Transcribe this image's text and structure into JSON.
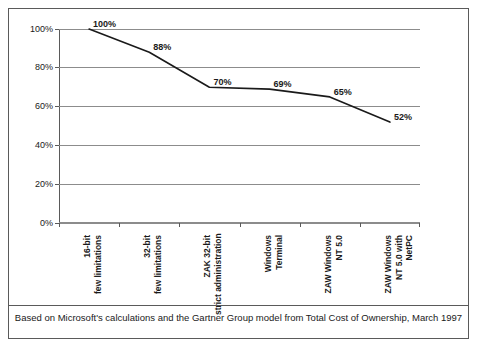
{
  "chart_data": {
    "type": "line",
    "title": "",
    "xlabel": "",
    "ylabel": "",
    "ylim": [
      0,
      100
    ],
    "grid": "horizontal",
    "legend": "none",
    "yticks": [
      "0%",
      "20%",
      "40%",
      "60%",
      "80%",
      "100%"
    ],
    "ytick_values": [
      0,
      20,
      40,
      60,
      80,
      100
    ],
    "categories": [
      "16-bit\nfew limitations",
      "32-bit\nfew limitations",
      "ZAK 32-bit\nstrict administration",
      "Windows\nTerminal",
      "ZAW Windows\nNT 5.0",
      "ZAW Windows\nNT 5.0 with\nNetPC"
    ],
    "category_lines": [
      [
        "16-bit",
        "few limitations"
      ],
      [
        "32-bit",
        "few limitations"
      ],
      [
        "ZAK 32-bit",
        "strict administration"
      ],
      [
        "Windows",
        "Terminal"
      ],
      [
        "ZAW Windows",
        "NT 5.0"
      ],
      [
        "ZAW Windows",
        "NT 5.0 with",
        "NetPC"
      ]
    ],
    "values": [
      100,
      88,
      70,
      69,
      65,
      52
    ],
    "data_labels": [
      "100%",
      "88%",
      "70%",
      "69%",
      "65%",
      "52%"
    ],
    "series_color": "#1a1a1a",
    "grid_color": "#8c8c8c",
    "axis_color": "#5a5a5a"
  },
  "caption": {
    "text": "Based on Microsoft's calculations and the Gartner Group model from Total Cost of Ownership, March 1997"
  }
}
